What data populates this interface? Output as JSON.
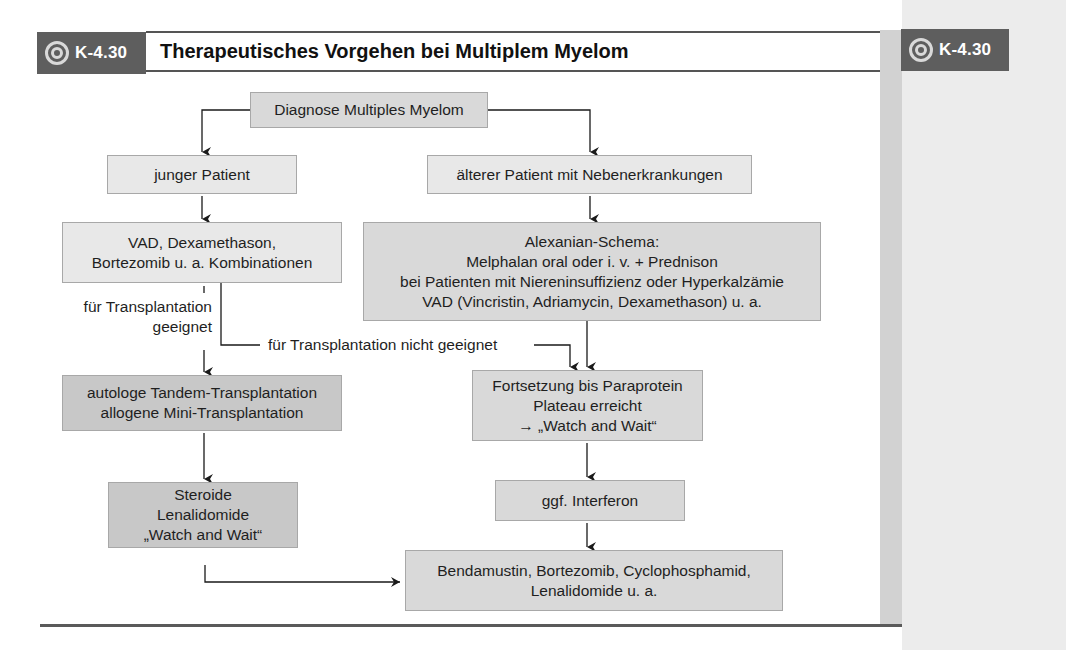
{
  "header": {
    "badge_label": "K-4.30",
    "badge_icon": "target-icon",
    "title": "Therapeutisches Vorgehen bei Multiplem Myelom",
    "margin_badge_label": "K-4.30"
  },
  "diagram": {
    "root": "Diagnose Multiples Myelom",
    "left_branch": {
      "patient": "junger Patient",
      "initial_therapy": [
        "VAD, Dexamethason,",
        "Bortezomib u. a. Kombinationen"
      ],
      "suitable_label": [
        "für Transplantation",
        "geeignet"
      ],
      "transplant": [
        "autologe Tandem-Transplantation",
        "allogene Mini-Transplantation"
      ],
      "maintenance": [
        "Steroide",
        "Lenalidomide",
        "„Watch and Wait“"
      ]
    },
    "right_branch": {
      "patient": "älterer Patient mit Nebenerkrankungen",
      "initial_therapy": [
        "Alexanian-Schema:",
        "Melphalan oral oder i. v. + Prednison",
        "bei Patienten mit Niereninsuffizienz oder Hyperkalzämie",
        "VAD (Vincristin, Adriamycin, Dexamethason) u. a."
      ],
      "continuation": [
        "Fortsetzung bis Paraprotein",
        "Plateau erreicht",
        "→ „Watch and Wait“"
      ],
      "interferon": "ggf. Interferon"
    },
    "not_suitable_label": "für Transplantation nicht geeignet",
    "relapse_therapy": [
      "Bendamustin, Bortezomib, Cyclophosphamid,",
      "Lenalidomide u. a."
    ]
  },
  "colors": {
    "badge_bg": "#5e5e5e",
    "box_light": "#e8e8e8",
    "box_mid": "#d9d9d9",
    "box_dark": "#c8c8c8",
    "margin_panel": "#ececec",
    "margin_stripe": "#d2d2d2"
  }
}
